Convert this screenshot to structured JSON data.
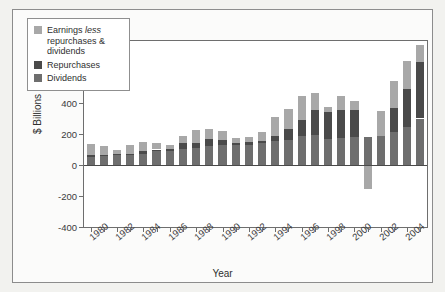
{
  "chart_data": {
    "type": "bar",
    "stacked": true,
    "title": "",
    "xlabel": "Year",
    "ylabel": "$ Billions",
    "ylim": [
      -400,
      800
    ],
    "yticks": [
      800,
      600,
      400,
      200,
      0,
      -200,
      -400
    ],
    "ytick_labels": [
      "800",
      "600",
      "400",
      "200",
      "0",
      "-200",
      "-400"
    ],
    "grid": false,
    "legend_position": "upper left",
    "categories": [
      "1980",
      "1981",
      "1982",
      "1983",
      "1984",
      "1985",
      "1986",
      "1987",
      "1988",
      "1989",
      "1990",
      "1991",
      "1992",
      "1993",
      "1994",
      "1995",
      "1996",
      "1997",
      "1998",
      "1999",
      "2000",
      "2001",
      "2002",
      "2003",
      "2004",
      "2005"
    ],
    "xtick_labels": [
      "1980",
      "1982",
      "1984",
      "1986",
      "1988",
      "1990",
      "1992",
      "1994",
      "1996",
      "1998",
      "2000",
      "2002",
      "2004"
    ],
    "series": [
      {
        "name": "Dividends",
        "color": "#6e6e6e",
        "values": [
          54,
          57,
          63,
          68,
          74,
          90,
          92,
          102,
          108,
          120,
          128,
          128,
          130,
          140,
          152,
          163,
          190,
          196,
          168,
          175,
          178,
          180,
          190,
          210,
          245,
          300
        ]
      },
      {
        "name": "Repurchases",
        "color": "#4a4a4a",
        "values": [
          10,
          8,
          6,
          6,
          18,
          10,
          12,
          38,
          36,
          46,
          34,
          16,
          16,
          16,
          38,
          70,
          100,
          160,
          172,
          180,
          176,
          0,
          0,
          160,
          245,
          365
        ]
      },
      {
        "name": "Earnings less repurchases & dividends",
        "color": "#a8a8a8",
        "values": [
          70,
          60,
          30,
          54,
          58,
          40,
          28,
          50,
          80,
          68,
          56,
          28,
          34,
          60,
          120,
          130,
          152,
          108,
          32,
          90,
          60,
          -155,
          158,
          172,
          180,
          110
        ]
      }
    ],
    "legend_entries": [
      {
        "label_html": "Earnings <em>less</em> repurchases & dividends",
        "color": "#a8a8a8"
      },
      {
        "label_html": "Repurchases",
        "color": "#4a4a4a"
      },
      {
        "label_html": "Dividends",
        "color": "#6e6e6e"
      }
    ]
  }
}
